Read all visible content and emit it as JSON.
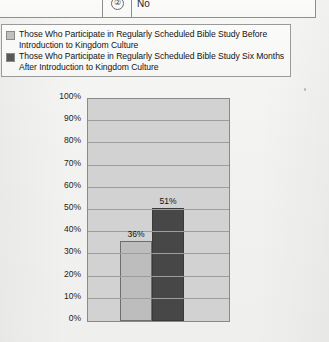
{
  "table_fragment": {
    "blank_cell": "",
    "number": "②",
    "answer": "No"
  },
  "legend": {
    "entries": [
      {
        "swatch_color": "#c0c0c0",
        "label": "Those Who Participate in Regularly Scheduled Bible Study Before Introduction to Kingdom Culture"
      },
      {
        "swatch_color": "#595959",
        "label": "Those Who Participate in Regularly Scheduled Bible Study Six Months After Introduction to Kingdom Culture"
      }
    ]
  },
  "chart_data": {
    "type": "bar",
    "title": "",
    "xlabel": "",
    "ylabel": "",
    "ylim": [
      0,
      100
    ],
    "grid": true,
    "legend_position": "top",
    "categories": [
      "Those Who Participate in Regularly Scheduled Bible Study Before Introduction to Kingdom Culture",
      "Those Who Participate in Regularly Scheduled Bible Study Six Months After Introduction to Kingdom Culture"
    ],
    "values": [
      36,
      51
    ],
    "data_labels": [
      "36%",
      "51%"
    ],
    "colors": [
      "#bdbdbd",
      "#474747"
    ],
    "ytick_labels": [
      "100%",
      "90%",
      "80%",
      "70%",
      "60%",
      "50%",
      "40%",
      "30%",
      "20%",
      "10%",
      "0%"
    ],
    "ytick_values": [
      100,
      90,
      80,
      70,
      60,
      50,
      40,
      30,
      20,
      10,
      0
    ],
    "plot_background": "#d2d2d2"
  }
}
